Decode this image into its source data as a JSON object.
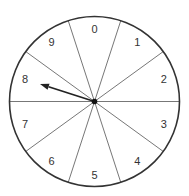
{
  "spinner": {
    "center": {
      "x": 94.5,
      "y": 101.5
    },
    "radius": 85,
    "sector_count": 10,
    "sector_angle_deg": 36,
    "first_boundary_deg": 18,
    "outline_color": "#333333",
    "divider_color": "#777777",
    "pointer_color": "#222222",
    "hub_color": "#111111",
    "label_radius": 73,
    "sectors": [
      {
        "label": "0",
        "center_deg": 0
      },
      {
        "label": "1",
        "center_deg": 36
      },
      {
        "label": "2",
        "center_deg": 72
      },
      {
        "label": "3",
        "center_deg": 108
      },
      {
        "label": "4",
        "center_deg": 144
      },
      {
        "label": "5",
        "center_deg": 180
      },
      {
        "label": "6",
        "center_deg": 216
      },
      {
        "label": "7",
        "center_deg": 252
      },
      {
        "label": "8",
        "center_deg": 288
      },
      {
        "label": "9",
        "center_deg": 324
      }
    ],
    "pointer": {
      "tip": {
        "x": 40,
        "y": 84
      },
      "points_to": "8"
    }
  }
}
